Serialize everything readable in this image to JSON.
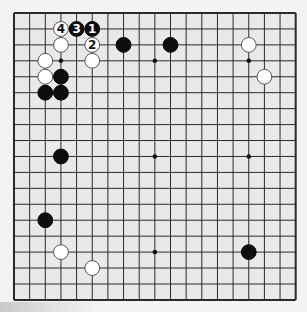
{
  "board": {
    "size": 19,
    "origin_x": 14,
    "origin_y": 13,
    "spacing_x": 15.65,
    "spacing_y": 15.94,
    "background": "#e9e9e9",
    "line_color": "#2a2a2a",
    "stone_radius": 7.4
  },
  "star_points": [
    [
      3,
      3
    ],
    [
      9,
      3
    ],
    [
      15,
      3
    ],
    [
      3,
      9
    ],
    [
      9,
      9
    ],
    [
      15,
      9
    ],
    [
      3,
      15
    ],
    [
      9,
      15
    ],
    [
      15,
      15
    ]
  ],
  "stones": [
    {
      "color": "white",
      "col": 3,
      "row": 1,
      "label": "4"
    },
    {
      "color": "black",
      "col": 4,
      "row": 1,
      "label": "3"
    },
    {
      "color": "black",
      "col": 5,
      "row": 1,
      "label": "1"
    },
    {
      "color": "white",
      "col": 3,
      "row": 2,
      "label": ""
    },
    {
      "color": "white",
      "col": 5,
      "row": 2,
      "label": "2"
    },
    {
      "color": "white",
      "col": 2,
      "row": 3,
      "label": ""
    },
    {
      "color": "white",
      "col": 5,
      "row": 3,
      "label": ""
    },
    {
      "color": "white",
      "col": 2,
      "row": 4,
      "label": ""
    },
    {
      "color": "black",
      "col": 3,
      "row": 4,
      "label": ""
    },
    {
      "color": "black",
      "col": 2,
      "row": 5,
      "label": ""
    },
    {
      "color": "black",
      "col": 3,
      "row": 5,
      "label": ""
    },
    {
      "color": "black",
      "col": 7,
      "row": 2,
      "label": ""
    },
    {
      "color": "black",
      "col": 10,
      "row": 2,
      "label": ""
    },
    {
      "color": "white",
      "col": 15,
      "row": 2,
      "label": ""
    },
    {
      "color": "white",
      "col": 16,
      "row": 4,
      "label": ""
    },
    {
      "color": "black",
      "col": 3,
      "row": 9,
      "label": ""
    },
    {
      "color": "black",
      "col": 2,
      "row": 13,
      "label": ""
    },
    {
      "color": "white",
      "col": 3,
      "row": 15,
      "label": ""
    },
    {
      "color": "white",
      "col": 5,
      "row": 16,
      "label": ""
    },
    {
      "color": "black",
      "col": 15,
      "row": 15,
      "label": ""
    }
  ]
}
